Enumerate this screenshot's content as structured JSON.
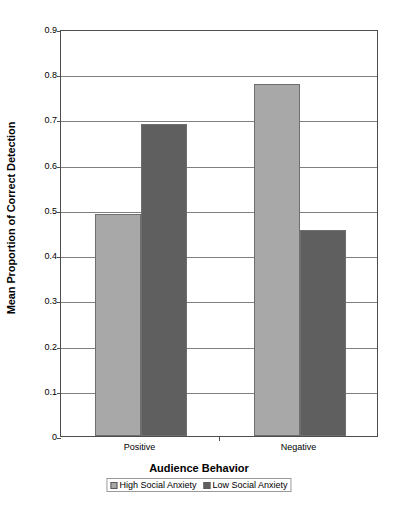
{
  "chart_data": {
    "type": "bar",
    "title": "",
    "xlabel": "Audience Behavior",
    "ylabel": "Mean Proportion of Correct Detection",
    "categories": [
      "Positive",
      "Negative"
    ],
    "series": [
      {
        "name": "High Social Anxiety",
        "color": "#a8a8a8",
        "values": [
          0.49,
          0.778
        ]
      },
      {
        "name": "Low Social Anxiety",
        "color": "#5f5f5f",
        "values": [
          0.69,
          0.456
        ]
      }
    ],
    "ylim": [
      0,
      0.9
    ],
    "ytick_labels": [
      "0.9",
      "0.8",
      "0.7",
      "0.6",
      "0.5",
      "0.4",
      "0.3",
      "0.2",
      "0.1",
      "0"
    ],
    "ytick_values": [
      0.9,
      0.8,
      0.7,
      0.6,
      0.5,
      0.4,
      0.3,
      0.2,
      0.1,
      0
    ],
    "grid": true,
    "legend_position": "bottom"
  },
  "axes": {
    "y_title": "Mean Proportion of Correct Detection",
    "x_title": "Audience Behavior"
  },
  "legend": {
    "entries": [
      {
        "label": "High Social Anxiety"
      },
      {
        "label": "Low Social Anxiety"
      }
    ]
  }
}
